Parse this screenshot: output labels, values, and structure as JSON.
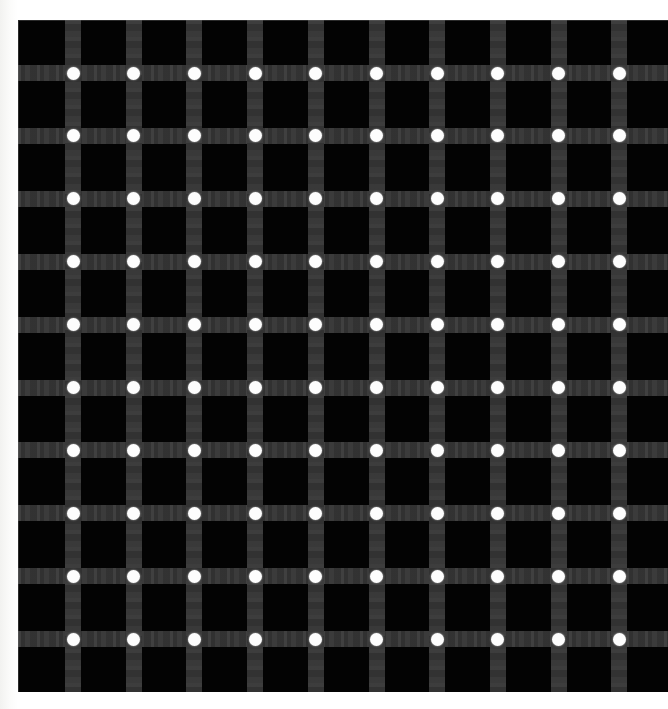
{
  "figure": {
    "kind": "optical-illusion-figure",
    "canvas": {
      "width": 668,
      "height": 709,
      "background": "#ffffff"
    }
  },
  "panel": {
    "left": 18,
    "top": 20,
    "width": 650,
    "height": 672,
    "background_color": "#030303"
  },
  "grid": {
    "columns": 10,
    "rows": 10,
    "bar_color": "#353535",
    "bar_thickness": 16,
    "dot_color": "#fdfdfd",
    "dot_diameter": 13,
    "first_intersection_x": 55,
    "first_intersection_y": 53,
    "column_spacing": 60.7,
    "row_spacing": 62.9,
    "column_centers_x": [
      55,
      115.7,
      176.4,
      237.1,
      297.8,
      358.5,
      419.2,
      479.9,
      540.6,
      601.3
    ],
    "row_centers_y": [
      53,
      115.9,
      178.8,
      241.7,
      304.6,
      367.5,
      430.4,
      493.3,
      556.2,
      619.1
    ],
    "dot_count": 100
  },
  "colors": {
    "background": "#ffffff",
    "panel": "#030303",
    "bars": "#353535",
    "dots": "#fdfdfd"
  }
}
